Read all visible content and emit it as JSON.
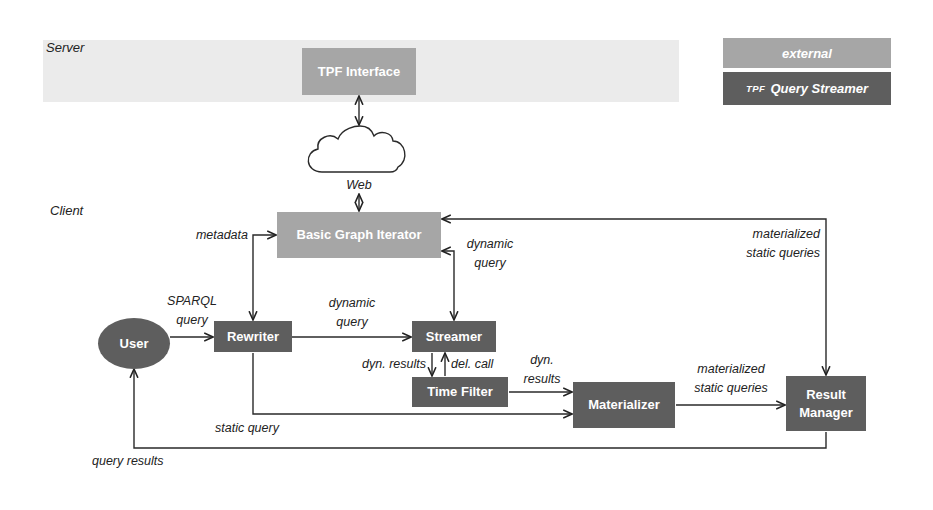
{
  "zones": {
    "server_label": "Server",
    "client_label": "Client"
  },
  "legend": {
    "external_label": "external",
    "tqs_prefix": "TPF",
    "tqs_label": "Query Streamer",
    "colors": {
      "external": "#a6a6a6",
      "tpf_query_streamer": "#5e5e5e"
    }
  },
  "nodes": {
    "tpf_interface": "TPF Interface",
    "web": "Web",
    "basic_graph_iterator": "Basic Graph Iterator",
    "user": "User",
    "rewriter": "Rewriter",
    "streamer": "Streamer",
    "time_filter": "Time Filter",
    "materializer": "Materializer",
    "result_manager_line1": "Result",
    "result_manager_line2": "Manager"
  },
  "edges": {
    "metadata": "metadata",
    "sparql_query_line1": "SPARQL",
    "sparql_query_line2": "query",
    "dynamic_query_mid_line1": "dynamic",
    "dynamic_query_mid_line2": "query",
    "dynamic_query_right_line1": "dynamic",
    "dynamic_query_right_line2": "query",
    "materialized_top_line1": "materialized",
    "materialized_top_line2": "static queries",
    "dyn_results": "dyn. results",
    "del_call": "del. call",
    "dyn_results2_line1": "dyn.",
    "dyn_results2_line2": "results",
    "materialized_bottom_line1": "materialized",
    "materialized_bottom_line2": "static queries",
    "static_query": "static query",
    "query_results": "query results"
  }
}
